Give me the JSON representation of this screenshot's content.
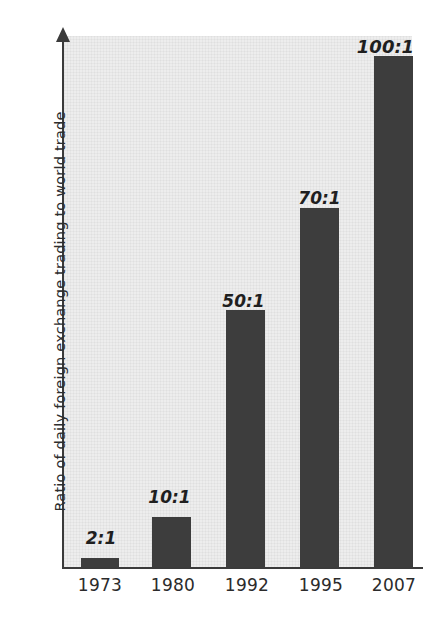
{
  "chart_data": {
    "type": "bar",
    "title": "",
    "subtitle": "",
    "xlabel": "",
    "ylabel": "Ratio of daily foreign exchange trading to world trade",
    "categories": [
      "1973",
      "1980",
      "1992",
      "1995",
      "2007"
    ],
    "values": [
      2,
      10,
      50,
      70,
      100
    ],
    "data_labels": [
      "2:1",
      "10:1",
      "50:1",
      "70:1",
      "100:1"
    ],
    "series": [
      {
        "name": "Ratio of daily foreign exchange trading to world trade",
        "values": [
          2,
          10,
          50,
          70,
          100
        ]
      }
    ],
    "ylim": [
      0,
      105
    ],
    "yticks": [],
    "ytick_labels": [],
    "grid": false,
    "legend": false,
    "legend_position": "none",
    "bar_color": "#3d3d3d",
    "plot_background_color": "#ededed",
    "axis_color": "#3b3b3b",
    "text_color": "#2b2b2b",
    "y_axis_has_arrow": true,
    "annotations": []
  },
  "bars": [
    {
      "category": "1973",
      "label": "2:1",
      "value": 2,
      "bar_left": 81,
      "bar_width": 38,
      "bar_height": 9,
      "label_left": 70,
      "label_top": 528,
      "label_font_size": 17
    },
    {
      "category": "1980",
      "label": "10:1",
      "value": 10,
      "bar_left": 152,
      "bar_width": 39,
      "bar_height": 50,
      "label_left": 138,
      "label_top": 487,
      "label_font_size": 17
    },
    {
      "category": "1992",
      "label": "50:1",
      "value": 50,
      "bar_left": 226,
      "bar_width": 39,
      "bar_height": 257,
      "label_left": 212,
      "label_top": 291,
      "label_font_size": 17
    },
    {
      "category": "1995",
      "label": "70:1",
      "value": 70,
      "bar_left": 300,
      "bar_width": 39,
      "bar_height": 359,
      "label_left": 288,
      "label_top": 188,
      "label_font_size": 17
    },
    {
      "category": "2007",
      "label": "100:1",
      "value": 100,
      "bar_left": 374,
      "bar_width": 39,
      "bar_height": 511,
      "label_left": 354,
      "label_top": 36,
      "label_font_size": 18
    }
  ],
  "x_ticks": [
    {
      "label": "1973",
      "left": 66,
      "width": 68
    },
    {
      "label": "1980",
      "left": 139,
      "width": 68
    },
    {
      "label": "1992",
      "left": 213,
      "width": 68
    },
    {
      "label": "1995",
      "left": 287,
      "width": 68
    },
    {
      "label": "2007",
      "left": 360,
      "width": 68
    }
  ]
}
